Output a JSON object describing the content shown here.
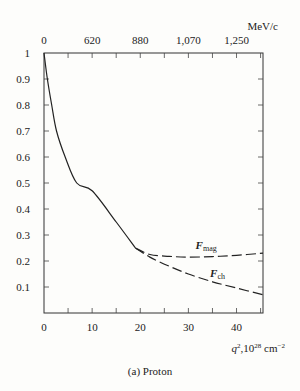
{
  "chart_data": {
    "type": "line",
    "title": "",
    "caption": "(a)  Proton",
    "xlabel": "q², 10²⁸ cm⁻²",
    "xlabel_parts": {
      "base": "q",
      "sup1": "2",
      "mid": ",10",
      "sup2": "28",
      "unit": " cm",
      "sup3": "−2"
    },
    "ylabel": "",
    "top_axis_label": "MeV/c",
    "xlim": [
      0,
      45.5
    ],
    "ylim": [
      0,
      1
    ],
    "x_ticks": [
      0,
      10,
      20,
      30,
      40
    ],
    "x_tick_labels": [
      "0",
      "10",
      "20",
      "30",
      "40"
    ],
    "y_ticks": [
      0.1,
      0.2,
      0.3,
      0.4,
      0.5,
      0.6,
      0.7,
      0.8,
      0.9,
      1
    ],
    "y_tick_labels": [
      "0.1",
      "0.2",
      "0.3",
      "0.4",
      "0.5",
      "0.6",
      "0.7",
      "0.8",
      "0.9",
      "1"
    ],
    "top_ticks_q2": [
      0,
      10,
      20,
      30,
      40
    ],
    "top_tick_labels": [
      "0",
      "620",
      "880",
      "1,070",
      "1,250"
    ],
    "grid": false,
    "series": [
      {
        "name": "common (measured)",
        "style": "solid",
        "x": [
          0,
          0.7,
          1.6,
          2.6,
          4.4,
          6.8,
          10,
          15,
          19
        ],
        "y": [
          1.0,
          0.9,
          0.8,
          0.7,
          0.6,
          0.5,
          0.47,
          0.35,
          0.25
        ]
      },
      {
        "name": "F_mag",
        "label_main": "F",
        "label_sub": "mag",
        "style": "dashed",
        "x": [
          19,
          22,
          26,
          30,
          35,
          40,
          45.5
        ],
        "y": [
          0.25,
          0.225,
          0.218,
          0.215,
          0.217,
          0.222,
          0.23
        ]
      },
      {
        "name": "F_ch",
        "label_main": "F",
        "label_sub": "ch",
        "style": "dashed",
        "x": [
          19,
          22,
          26,
          30,
          35,
          40,
          45.5
        ],
        "y": [
          0.25,
          0.215,
          0.18,
          0.15,
          0.12,
          0.096,
          0.07
        ]
      }
    ]
  }
}
